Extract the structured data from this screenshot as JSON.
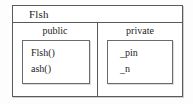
{
  "diagram": {
    "type": "uml-class-diagram",
    "class": {
      "name": "Flsh",
      "compartments": [
        {
          "visibility": "public",
          "label": "public",
          "members": [
            "Flsh()",
            "ash()"
          ]
        },
        {
          "visibility": "private",
          "label": "private",
          "members": [
            "_pin",
            "_n"
          ]
        }
      ]
    },
    "colors": {
      "background": "#fdfdfd",
      "box_fill": "#ffffff",
      "border": "#5a5a5a",
      "inner_border": "#6b6b6b",
      "text": "#1d1d1d"
    }
  }
}
